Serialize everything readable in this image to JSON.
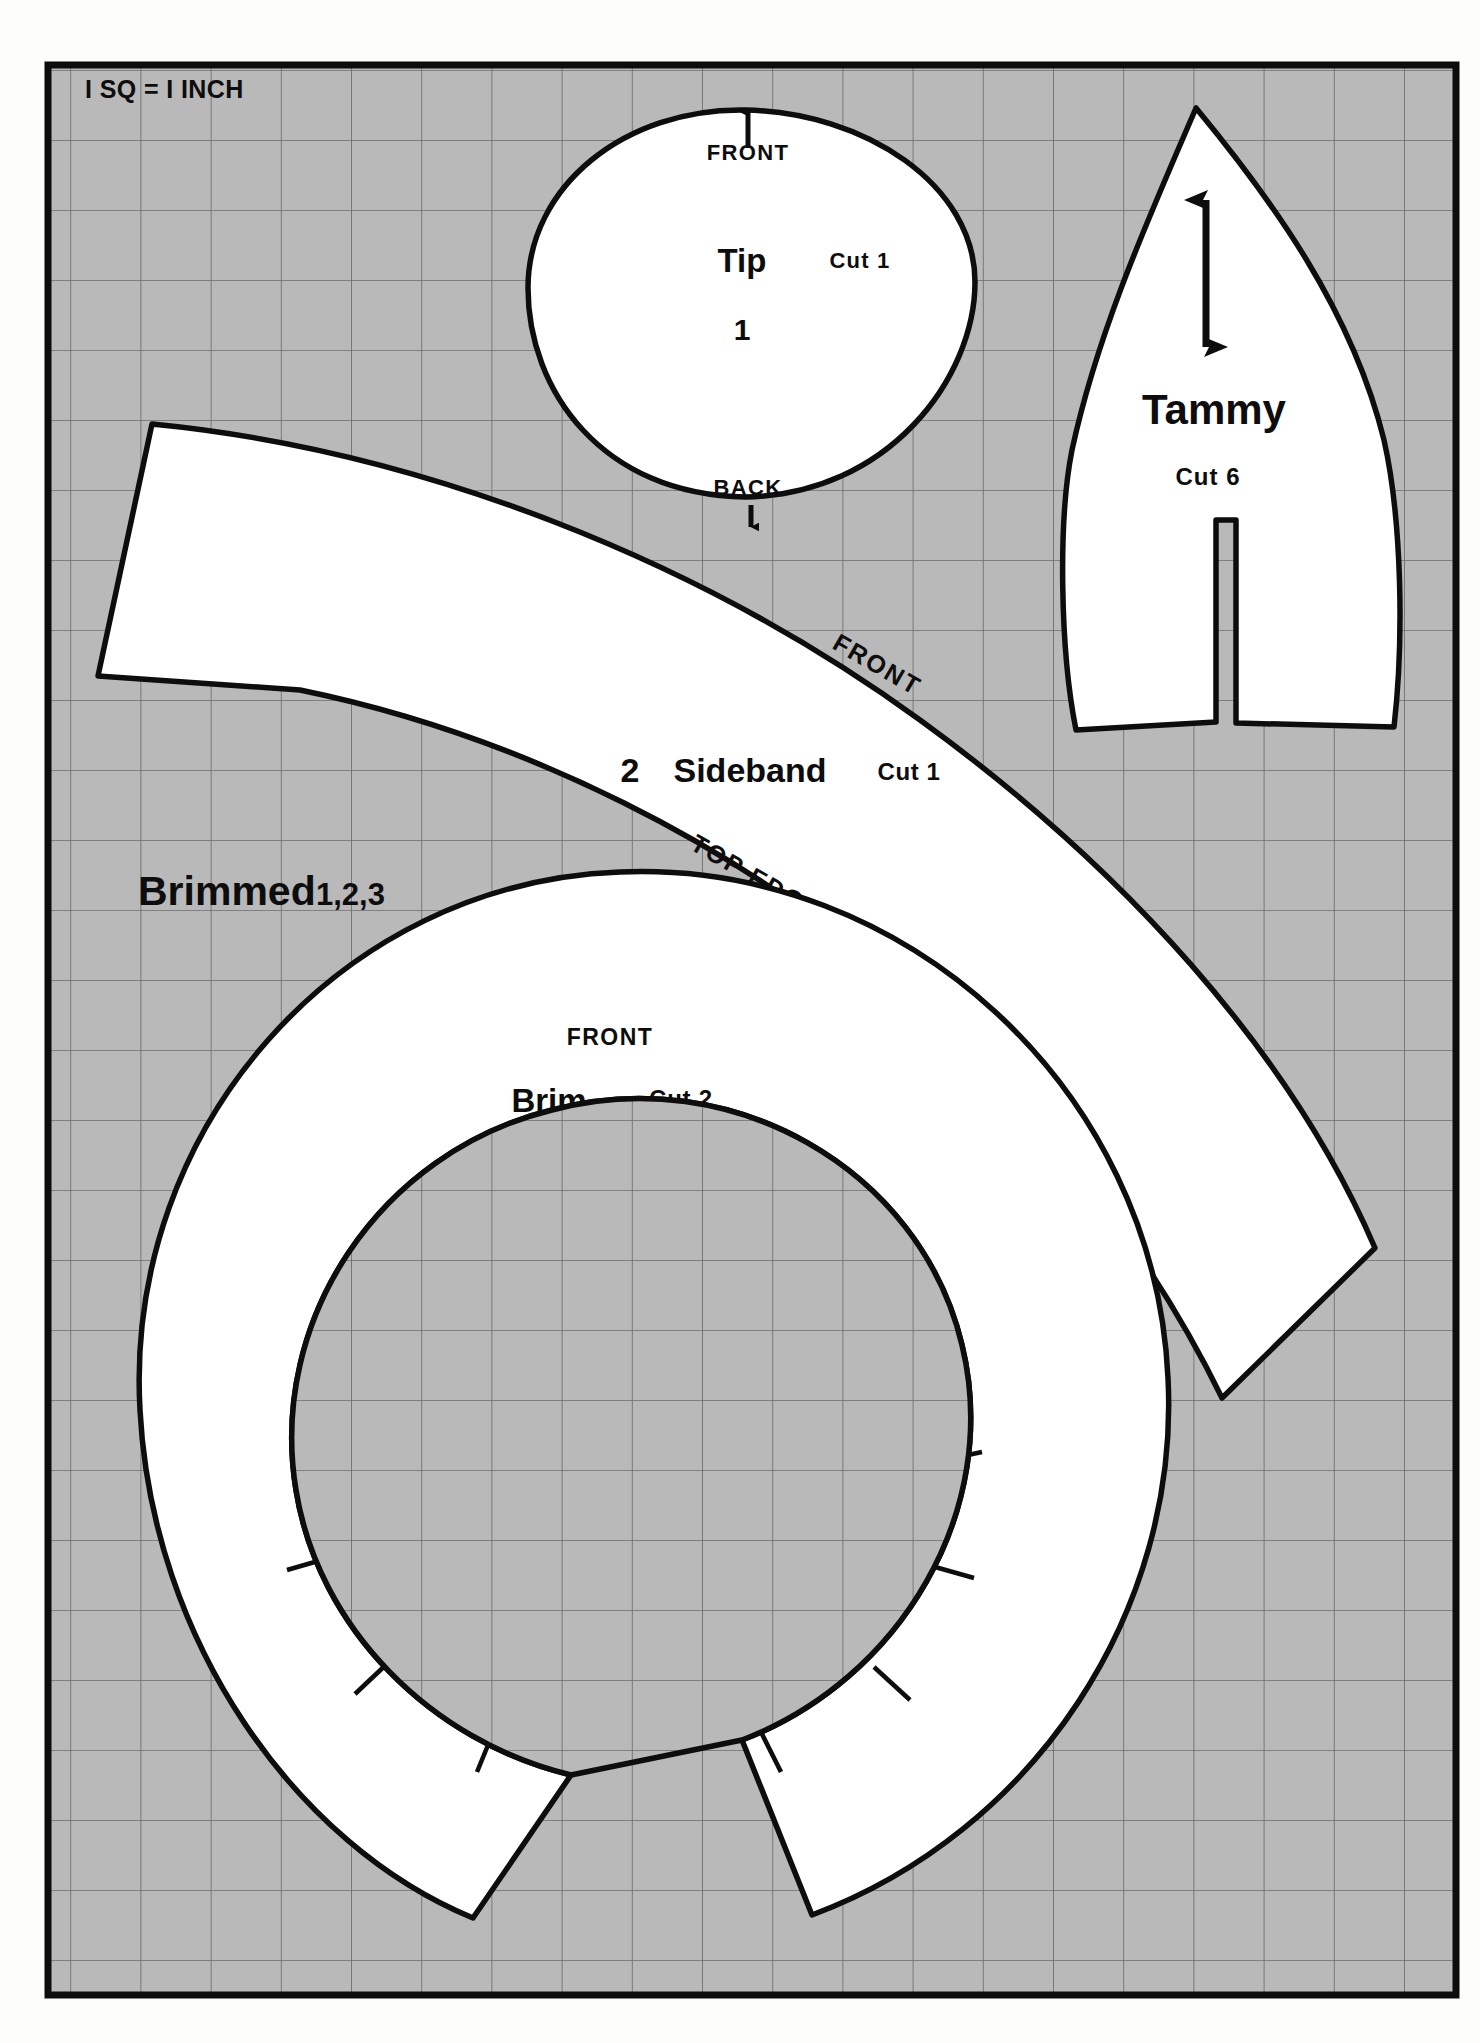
{
  "sheet": {
    "background_color": "#fdfdfb",
    "grid_fill_color": "#b8b8b8",
    "piece_fill_color": "#ffffff",
    "ink_color": "#0d0d0d",
    "grid_line_color": "#6f6f6f",
    "scale_legend": "I SQ = I INCH",
    "title": "Brimmed 1,2,3",
    "title_suffix": "1,2,3",
    "title_main": "Brimmed"
  },
  "pieces": [
    {
      "id": "tip",
      "number": "1",
      "name": "Tip",
      "cut": "Cut 1",
      "front_label": "FRONT",
      "back_label": "BACK",
      "front_arrow": "arrow-up",
      "back_arrow": "arrow-down"
    },
    {
      "id": "tammy",
      "name": "Tammy",
      "cut": "Cut 6",
      "grainline": "double-arrow-vertical"
    },
    {
      "id": "sideband",
      "number": "2",
      "name": "Sideband",
      "cut": "Cut 1",
      "front_label": "FRONT",
      "top_edge_label": "TOP EDGE"
    },
    {
      "id": "brim",
      "number": "3",
      "name": "Brim",
      "cut": "Cut 2",
      "front_label": "FRONT"
    }
  ]
}
